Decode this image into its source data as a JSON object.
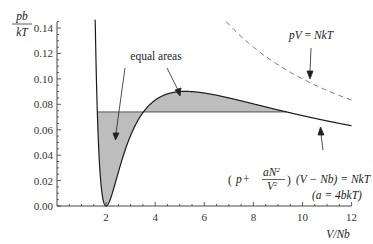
{
  "chart_data": {
    "type": "line",
    "title": "",
    "xlabel": "V/Nb",
    "ylabel_numerator": "pb",
    "ylabel_denominator": "kT",
    "xlim": [
      0,
      12
    ],
    "ylim": [
      0,
      0.15
    ],
    "x_ticks": [
      2,
      4,
      6,
      8,
      10,
      12
    ],
    "x_tick_labels": [
      "2",
      "4",
      "6",
      "8",
      "10",
      "12"
    ],
    "y_ticks": [
      0.0,
      0.02,
      0.04,
      0.06,
      0.08,
      0.1,
      0.12,
      0.14
    ],
    "y_tick_labels": [
      "0.00",
      "0.02",
      "0.04",
      "0.06",
      "0.08",
      "0.10",
      "0.12",
      "0.14"
    ],
    "grid": false,
    "series": [
      {
        "name": "van der Waals isotherm",
        "style": "solid",
        "formula": "pb/kT = 1/(v-1) - 4/v^2",
        "x": [
          1.5,
          1.6,
          1.7,
          1.8,
          1.9,
          2.0,
          2.2,
          2.5,
          3.0,
          3.5,
          4.0,
          5.0,
          6.0,
          7.0,
          8.0,
          9.0,
          10.0,
          11.0,
          12.0
        ],
        "values": [
          0.222,
          0.104,
          0.044,
          0.0156,
          0.0031,
          0.0,
          0.0069,
          0.0267,
          0.0556,
          0.0735,
          0.0833,
          0.09,
          0.0889,
          0.085,
          0.0804,
          0.0756,
          0.0711,
          0.0669,
          0.0631
        ]
      },
      {
        "name": "pV = NkT",
        "style": "dashed",
        "formula": "pb/kT = 1/v",
        "x": [
          7.0,
          8.0,
          9.0,
          10.0,
          11.0,
          12.0
        ],
        "values": [
          0.143,
          0.125,
          0.111,
          0.1,
          0.0909,
          0.0833
        ]
      },
      {
        "name": "Maxwell construction line",
        "style": "solid",
        "x": [
          1.6,
          9.6
        ],
        "values": [
          0.074,
          0.074
        ]
      }
    ],
    "shaded_regions": "equal areas between isotherm and horizontal line at pb/kT ≈ 0.074",
    "annotations": [
      {
        "text": "equal areas",
        "x": 4.6,
        "y": 0.12
      },
      {
        "text": "pV = NkT",
        "x": 10.6,
        "y": 0.138
      },
      {
        "text": "(p + aN²/V²)(V − Nb) = NkT",
        "x": 8.5,
        "y": 0.026
      },
      {
        "text": "(a = 4bkT)",
        "x": 10.3,
        "y": 0.011
      }
    ]
  },
  "labels": {
    "y_num": "pb",
    "y_den": "kT",
    "x_axis": "V/Nb",
    "equal_areas": "equal areas",
    "ideal_gas_p": "pV",
    "ideal_gas_eq": " = ",
    "ideal_gas_r": "NkT",
    "vdw_p": "p",
    "vdw_plus": " + ",
    "vdw_frac_num": "aN",
    "vdw_frac_num_exp": "2",
    "vdw_frac_den": "V",
    "vdw_frac_den_exp": "2",
    "vdw_rest_l": "(V − Nb) = ",
    "vdw_rest_r": "NkT",
    "vdw_cond": "(a = 4bkT)"
  },
  "colors": {
    "curve": "#1a1a1a",
    "shade": "#bdbdbd",
    "dashed": "#6f6f6f",
    "axis": "#333333"
  }
}
